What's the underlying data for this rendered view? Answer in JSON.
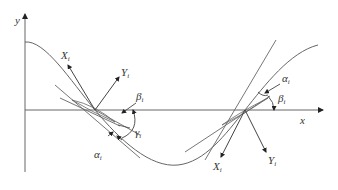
{
  "diagram": {
    "axes": {
      "x_label": "x",
      "y_label": "y"
    },
    "left_point": {
      "frame_x_label": "X",
      "frame_x_sub": "i",
      "frame_y_label": "Y",
      "frame_y_sub": "i",
      "angle_beta": "β",
      "angle_beta_sub": "i",
      "angle_gamma": "γ",
      "angle_gamma_sub": "i",
      "angle_alpha": "α",
      "angle_alpha_sub": "i"
    },
    "right_point": {
      "frame_x_label": "X",
      "frame_x_sub": "i",
      "frame_y_label": "Y",
      "frame_y_sub": "i",
      "angle_alpha": "α",
      "angle_alpha_sub": "i",
      "angle_beta": "β",
      "angle_beta_sub": "i"
    },
    "colors": {
      "line": "#555555",
      "curve": "#666666",
      "text": "#333333"
    }
  }
}
